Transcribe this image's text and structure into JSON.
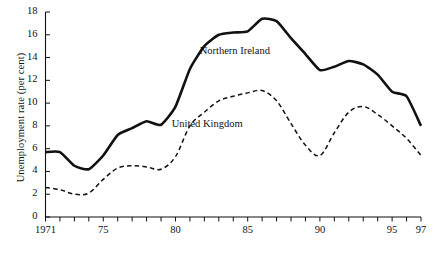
{
  "chart_data": {
    "type": "line",
    "title": "",
    "xlabel": "",
    "ylabel": "Unemployment rate (per cent)",
    "xlim": [
      1971,
      1997
    ],
    "ylim": [
      0,
      18
    ],
    "ytick_step": 2,
    "yticks": [
      0,
      2,
      4,
      6,
      8,
      10,
      12,
      14,
      16,
      18
    ],
    "ytick_labels": [
      "0",
      "2",
      "4",
      "6",
      "8",
      "10",
      "12",
      "14",
      "16",
      "18"
    ],
    "xticks": [
      1971,
      1972,
      1973,
      1974,
      1975,
      1976,
      1977,
      1978,
      1979,
      1980,
      1981,
      1982,
      1983,
      1984,
      1985,
      1986,
      1987,
      1988,
      1989,
      1990,
      1991,
      1992,
      1993,
      1994,
      1995,
      1996,
      1997
    ],
    "xtick_labels": [
      {
        "x": 1971,
        "label": "1971"
      },
      {
        "x": 1975,
        "label": "75"
      },
      {
        "x": 1980,
        "label": "80"
      },
      {
        "x": 1985,
        "label": "85"
      },
      {
        "x": 1990,
        "label": "90"
      },
      {
        "x": 1995,
        "label": "95"
      },
      {
        "x": 1997,
        "label": "97"
      }
    ],
    "grid": false,
    "legend_position": "inline-annotations",
    "x": [
      1971,
      1972,
      1973,
      1974,
      1975,
      1976,
      1977,
      1978,
      1979,
      1980,
      1981,
      1982,
      1983,
      1984,
      1985,
      1986,
      1987,
      1988,
      1989,
      1990,
      1991,
      1992,
      1993,
      1994,
      1995,
      1996,
      1997
    ],
    "series": [
      {
        "name": "Northern Ireland",
        "style": "solid",
        "color": "#111111",
        "width": 2.6,
        "values": [
          5.7,
          5.7,
          4.5,
          4.2,
          5.4,
          7.2,
          7.8,
          8.4,
          8.1,
          9.7,
          13.0,
          15.0,
          16.0,
          16.2,
          16.3,
          17.4,
          17.2,
          15.7,
          14.3,
          12.9,
          13.2,
          13.7,
          13.4,
          12.5,
          11.0,
          10.6,
          8.0
        ]
      },
      {
        "name": "United Kingdom",
        "style": "dashed",
        "color": "#111111",
        "width": 1.5,
        "values": [
          2.6,
          2.4,
          2.0,
          2.1,
          3.3,
          4.3,
          4.5,
          4.4,
          4.2,
          5.3,
          8.0,
          9.2,
          10.2,
          10.6,
          10.9,
          11.1,
          10.2,
          8.2,
          6.3,
          5.4,
          7.4,
          9.2,
          9.7,
          9.0,
          8.0,
          6.9,
          5.4
        ]
      }
    ],
    "annotations": [
      {
        "text": "Northern Ireland",
        "x": 1984.1,
        "y": 14.65
      },
      {
        "text": "United Kingdom",
        "x": 1982.2,
        "y": 8.25
      }
    ]
  }
}
